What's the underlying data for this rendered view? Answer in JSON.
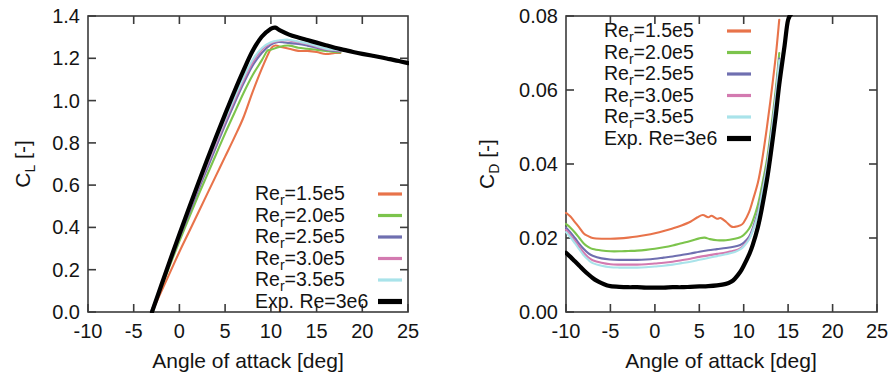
{
  "figure": {
    "background": "#ffffff",
    "panel_count": 2
  },
  "panels": [
    {
      "id": "cl-panel",
      "ylabel_main": "C",
      "ylabel_sub": "L",
      "ylabel_unit": " [-]",
      "xlabel": "Angle of attack [deg]",
      "x_ticks": [
        "-10",
        "-5",
        "0",
        "5",
        "10",
        "15",
        "20",
        "25"
      ],
      "y_ticks": [
        "0.0",
        "0.2",
        "0.4",
        "0.6",
        "0.8",
        "1.0",
        "1.2",
        "1.4"
      ],
      "legend_position": "bottom-right"
    },
    {
      "id": "cd-panel",
      "ylabel_main": "C",
      "ylabel_sub": "D",
      "ylabel_unit": " [-]",
      "xlabel": "Angle of attack [deg]",
      "x_ticks": [
        "-10",
        "-5",
        "0",
        "5",
        "10",
        "15",
        "20",
        "25"
      ],
      "y_ticks": [
        "0.00",
        "0.02",
        "0.04",
        "0.06",
        "0.08"
      ],
      "legend_position": "top-left"
    }
  ],
  "legend": {
    "entries": [
      {
        "prefix": "Re",
        "sub": "r",
        "suffix": "=1.5e5",
        "color": "#e8734a",
        "weight": "thin"
      },
      {
        "prefix": "Re",
        "sub": "r",
        "suffix": "=2.0e5",
        "color": "#7cc44c",
        "weight": "thin"
      },
      {
        "prefix": "Re",
        "sub": "r",
        "suffix": "=2.5e5",
        "color": "#6f6fb0",
        "weight": "thin"
      },
      {
        "prefix": "Re",
        "sub": "r",
        "suffix": "=3.0e5",
        "color": "#d37ab0",
        "weight": "thin"
      },
      {
        "prefix": "Re",
        "sub": "r",
        "suffix": "=3.5e5",
        "color": "#a9e3ea",
        "weight": "thin"
      },
      {
        "prefix": "Exp. Re=3e6",
        "sub": "",
        "suffix": "",
        "color": "#000000",
        "weight": "thick"
      }
    ]
  },
  "chart_data": [
    {
      "type": "line",
      "title": "",
      "xlabel": "Angle of attack [deg]",
      "ylabel": "C_L [-]",
      "xlim": [
        -10,
        25
      ],
      "ylim": [
        0.0,
        1.4
      ],
      "xticks": [
        -10,
        -5,
        0,
        5,
        10,
        15,
        20,
        25
      ],
      "yticks": [
        0.0,
        0.2,
        0.4,
        0.6,
        0.8,
        1.0,
        1.2,
        1.4
      ],
      "grid": false,
      "legend_position": "lower right",
      "series": [
        {
          "name": "Re_r=1.5e5",
          "color": "#e8734a",
          "x": [
            -3.0,
            -2.0,
            -1.0,
            0.0,
            1.0,
            2.0,
            3.0,
            4.0,
            5.0,
            6.0,
            7.0,
            8.0,
            9.0,
            10.0,
            10.5,
            11.0,
            12.0,
            13.0,
            14.0,
            15.0,
            16.0,
            17.0,
            17.6
          ],
          "y": [
            0.0,
            0.095,
            0.19,
            0.285,
            0.375,
            0.465,
            0.555,
            0.645,
            0.735,
            0.825,
            0.92,
            1.04,
            1.15,
            1.245,
            1.26,
            1.255,
            1.245,
            1.235,
            1.235,
            1.23,
            1.22,
            1.225,
            1.225
          ]
        },
        {
          "name": "Re_r=2.0e5",
          "color": "#7cc44c",
          "x": [
            -3.1,
            -2.0,
            -1.0,
            0.0,
            1.0,
            2.0,
            3.0,
            4.0,
            5.0,
            6.0,
            7.0,
            8.0,
            9.0,
            9.6,
            10.0,
            11.0,
            12.0,
            13.0,
            14.0,
            15.0,
            16.0,
            17.0,
            17.6
          ],
          "y": [
            0.0,
            0.115,
            0.225,
            0.335,
            0.44,
            0.545,
            0.645,
            0.745,
            0.845,
            0.94,
            1.035,
            1.12,
            1.19,
            1.235,
            1.24,
            1.255,
            1.26,
            1.25,
            1.245,
            1.24,
            1.235,
            1.23,
            1.228
          ]
        },
        {
          "name": "Re_r=2.5e5",
          "color": "#6f6fb0",
          "x": [
            -3.1,
            -2.0,
            -1.0,
            0.0,
            1.0,
            2.0,
            3.0,
            4.0,
            5.0,
            6.0,
            7.0,
            8.0,
            9.0,
            10.0,
            10.8,
            11.5,
            12.0,
            13.0,
            14.0,
            15.0,
            16.0,
            17.0,
            17.6
          ],
          "y": [
            0.0,
            0.12,
            0.235,
            0.35,
            0.46,
            0.57,
            0.675,
            0.78,
            0.885,
            0.985,
            1.08,
            1.165,
            1.225,
            1.265,
            1.277,
            1.275,
            1.272,
            1.268,
            1.26,
            1.25,
            1.24,
            1.235,
            1.232
          ]
        },
        {
          "name": "Re_r=3.0e5",
          "color": "#d37ab0",
          "x": [
            -3.1,
            -2.0,
            -1.0,
            0.0,
            1.0,
            2.0,
            3.0,
            4.0,
            5.0,
            6.0,
            7.0,
            8.0,
            9.0,
            10.0,
            11.0,
            11.8,
            12.5,
            13.0,
            14.0,
            15.0,
            16.0,
            17.0,
            17.6
          ],
          "y": [
            0.0,
            0.122,
            0.24,
            0.357,
            0.47,
            0.582,
            0.69,
            0.797,
            0.9,
            1.0,
            1.095,
            1.18,
            1.24,
            1.272,
            1.283,
            1.285,
            1.28,
            1.276,
            1.268,
            1.255,
            1.243,
            1.238,
            1.236
          ]
        },
        {
          "name": "Re_r=3.5e5",
          "color": "#a9e3ea",
          "x": [
            -3.1,
            -2.0,
            -1.0,
            0.0,
            1.0,
            2.0,
            3.0,
            4.0,
            5.0,
            6.0,
            7.0,
            8.0,
            9.0,
            10.0,
            11.0,
            11.9,
            12.6,
            13.0,
            14.0,
            15.0,
            16.0,
            17.0,
            17.6
          ],
          "y": [
            0.0,
            0.124,
            0.245,
            0.363,
            0.478,
            0.59,
            0.7,
            0.808,
            0.912,
            1.012,
            1.108,
            1.192,
            1.248,
            1.276,
            1.285,
            1.288,
            1.283,
            1.279,
            1.27,
            1.258,
            1.245,
            1.24,
            1.238
          ]
        },
        {
          "name": "Exp. Re=3e6",
          "color": "#000000",
          "x": [
            -3.0,
            -2.0,
            -1.0,
            0.0,
            1.0,
            2.0,
            3.0,
            4.0,
            5.0,
            6.0,
            7.0,
            8.0,
            9.0,
            10.0,
            10.5,
            11.0,
            12.0,
            13.0,
            14.0,
            15.0,
            16.0,
            17.0,
            18.0,
            19.0,
            20.0,
            21.0,
            22.0,
            23.0,
            24.0,
            25.0
          ],
          "y": [
            0.0,
            0.124,
            0.248,
            0.368,
            0.486,
            0.602,
            0.716,
            0.828,
            0.936,
            1.042,
            1.142,
            1.234,
            1.302,
            1.34,
            1.345,
            1.332,
            1.312,
            1.298,
            1.286,
            1.274,
            1.262,
            1.25,
            1.24,
            1.23,
            1.221,
            1.213,
            1.205,
            1.196,
            1.187,
            1.177
          ]
        }
      ]
    },
    {
      "type": "line",
      "title": "",
      "xlabel": "Angle of attack [deg]",
      "ylabel": "C_D [-]",
      "xlim": [
        -10,
        25
      ],
      "ylim": [
        0.0,
        0.08
      ],
      "xticks": [
        -10,
        -5,
        0,
        5,
        10,
        15,
        20,
        25
      ],
      "yticks": [
        0.0,
        0.02,
        0.04,
        0.06,
        0.08
      ],
      "grid": false,
      "legend_position": "upper left",
      "series": [
        {
          "name": "Re_r=1.5e5",
          "color": "#e8734a",
          "x": [
            -10.0,
            -9.5,
            -9.0,
            -8.5,
            -8.0,
            -7.5,
            -7.0,
            -6.0,
            -5.0,
            -4.0,
            -3.0,
            -2.0,
            -1.0,
            0.0,
            1.0,
            2.0,
            3.0,
            4.0,
            4.8,
            5.4,
            6.0,
            6.4,
            7.0,
            7.4,
            8.0,
            8.6,
            9.0,
            9.6,
            10.0,
            10.6,
            11.0,
            11.6,
            12.0,
            12.5,
            13.0,
            13.6,
            14.0
          ],
          "y": [
            0.0268,
            0.0258,
            0.0243,
            0.0228,
            0.0212,
            0.0205,
            0.02,
            0.0198,
            0.0198,
            0.0199,
            0.0201,
            0.0204,
            0.0208,
            0.0213,
            0.0219,
            0.0226,
            0.0234,
            0.0244,
            0.0256,
            0.0262,
            0.0256,
            0.026,
            0.0252,
            0.0254,
            0.0244,
            0.0231,
            0.023,
            0.0234,
            0.0242,
            0.027,
            0.03,
            0.035,
            0.04,
            0.048,
            0.057,
            0.069,
            0.079
          ]
        },
        {
          "name": "Re_r=2.0e5",
          "color": "#7cc44c",
          "x": [
            -10.0,
            -9.5,
            -9.0,
            -8.5,
            -8.0,
            -7.5,
            -7.0,
            -6.0,
            -5.0,
            -4.0,
            -3.0,
            -2.0,
            -1.0,
            0.0,
            1.0,
            2.0,
            3.0,
            4.0,
            5.0,
            5.6,
            6.2,
            7.0,
            8.0,
            9.0,
            9.6,
            10.0,
            10.6,
            11.0,
            11.6,
            12.0,
            12.6,
            13.0,
            13.6,
            14.0
          ],
          "y": [
            0.0238,
            0.0228,
            0.0215,
            0.02,
            0.0185,
            0.0176,
            0.017,
            0.0166,
            0.0164,
            0.0164,
            0.0165,
            0.0166,
            0.0168,
            0.0171,
            0.0175,
            0.018,
            0.0186,
            0.0192,
            0.0199,
            0.0201,
            0.0197,
            0.0194,
            0.0194,
            0.0198,
            0.0202,
            0.0208,
            0.0225,
            0.0245,
            0.029,
            0.0335,
            0.041,
            0.048,
            0.06,
            0.07
          ]
        },
        {
          "name": "Re_r=2.5e5",
          "color": "#6f6fb0",
          "x": [
            -10.0,
            -9.5,
            -9.0,
            -8.5,
            -8.0,
            -7.5,
            -7.0,
            -6.0,
            -5.0,
            -4.0,
            -3.0,
            -2.0,
            -1.0,
            0.0,
            1.0,
            2.0,
            3.0,
            4.0,
            5.0,
            6.0,
            7.0,
            8.0,
            9.0,
            9.6,
            10.0,
            10.6,
            11.0,
            11.6,
            12.0,
            12.6,
            13.0,
            13.6,
            14.0
          ],
          "y": [
            0.0228,
            0.0215,
            0.02,
            0.0184,
            0.017,
            0.0159,
            0.0152,
            0.0145,
            0.0142,
            0.0141,
            0.0141,
            0.0141,
            0.0142,
            0.0144,
            0.0147,
            0.015,
            0.0154,
            0.0158,
            0.0163,
            0.0167,
            0.017,
            0.0173,
            0.0177,
            0.0181,
            0.0187,
            0.0203,
            0.0225,
            0.027,
            0.0318,
            0.0395,
            0.0465,
            0.0585,
            0.0685
          ]
        },
        {
          "name": "Re_r=3.0e5",
          "color": "#d37ab0",
          "x": [
            -10.0,
            -9.5,
            -9.0,
            -8.5,
            -8.0,
            -7.5,
            -7.0,
            -6.0,
            -5.0,
            -4.0,
            -3.0,
            -2.0,
            -1.0,
            0.0,
            1.0,
            2.0,
            3.0,
            4.0,
            5.0,
            6.0,
            7.0,
            8.0,
            9.0,
            9.6,
            10.0,
            10.6,
            11.0,
            11.6,
            12.0,
            12.6,
            13.0,
            13.6,
            14.0
          ],
          "y": [
            0.0222,
            0.0208,
            0.0192,
            0.0176,
            0.016,
            0.0148,
            0.014,
            0.0133,
            0.0129,
            0.0128,
            0.0128,
            0.0128,
            0.0129,
            0.0131,
            0.0133,
            0.0136,
            0.014,
            0.0144,
            0.0149,
            0.0153,
            0.0157,
            0.0161,
            0.0166,
            0.0172,
            0.018,
            0.0198,
            0.022,
            0.0265,
            0.0313,
            0.039,
            0.046,
            0.058,
            0.068
          ]
        },
        {
          "name": "Re_r=3.5e5",
          "color": "#a9e3ea",
          "x": [
            -10.0,
            -9.5,
            -9.0,
            -8.5,
            -8.0,
            -7.5,
            -7.0,
            -6.0,
            -5.0,
            -4.0,
            -3.0,
            -2.0,
            -1.0,
            0.0,
            1.0,
            2.0,
            3.0,
            4.0,
            5.0,
            6.0,
            7.0,
            8.0,
            9.0,
            9.6,
            10.0,
            10.6,
            11.0,
            11.6,
            12.0,
            12.6,
            13.0,
            13.6,
            14.0
          ],
          "y": [
            0.0216,
            0.0202,
            0.0186,
            0.0169,
            0.0153,
            0.0141,
            0.0132,
            0.0125,
            0.0121,
            0.012,
            0.012,
            0.012,
            0.0121,
            0.0123,
            0.0125,
            0.0128,
            0.0132,
            0.0136,
            0.0141,
            0.0146,
            0.0151,
            0.0156,
            0.0162,
            0.0169,
            0.0177,
            0.0196,
            0.0218,
            0.0263,
            0.0311,
            0.0388,
            0.0458,
            0.0578,
            0.068
          ]
        },
        {
          "name": "Exp. Re=3e6",
          "color": "#000000",
          "x": [
            -10.0,
            -9.5,
            -9.0,
            -8.5,
            -8.0,
            -7.5,
            -7.0,
            -6.5,
            -6.0,
            -5.5,
            -5.0,
            -4.0,
            -3.0,
            -2.0,
            -1.0,
            0.0,
            1.0,
            2.0,
            3.0,
            4.0,
            5.0,
            6.0,
            7.0,
            8.0,
            8.6,
            9.0,
            9.6,
            10.0,
            10.6,
            11.0,
            11.6,
            12.0,
            12.6,
            13.0,
            13.6,
            14.0,
            14.6,
            15.0,
            15.6,
            16.0
          ],
          "y": [
            0.016,
            0.0149,
            0.0137,
            0.0125,
            0.0113,
            0.0102,
            0.0092,
            0.0084,
            0.0078,
            0.0073,
            0.007,
            0.0068,
            0.0067,
            0.0067,
            0.0066,
            0.0066,
            0.0066,
            0.0067,
            0.0067,
            0.0068,
            0.0069,
            0.007,
            0.0072,
            0.0076,
            0.0082,
            0.009,
            0.0108,
            0.0125,
            0.0155,
            0.018,
            0.023,
            0.0275,
            0.0355,
            0.042,
            0.053,
            0.0615,
            0.072,
            0.079,
            0.088,
            0.095
          ]
        }
      ]
    }
  ]
}
